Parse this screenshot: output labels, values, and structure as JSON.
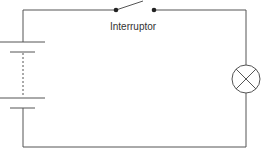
{
  "diagram": {
    "type": "electric-circuit",
    "components": [
      {
        "kind": "battery",
        "cells": 2,
        "position": "left"
      },
      {
        "kind": "switch",
        "state": "open",
        "position": "top",
        "label": "Interruptor"
      },
      {
        "kind": "lamp",
        "position": "right"
      }
    ],
    "switch_label": "Interruptor",
    "colors": {
      "line": "#555555",
      "background": "#ffffff"
    }
  }
}
